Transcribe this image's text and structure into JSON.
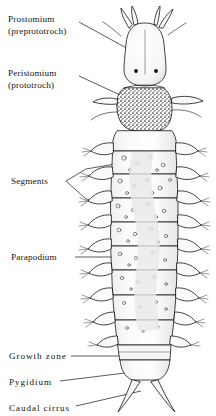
{
  "figure": {
    "title": "",
    "background_color": "#ffffff",
    "ink_color": "#141414"
  },
  "labels": [
    {
      "id": "prostomium",
      "line1": "Prostomium",
      "line2": "(preprototroch)",
      "x": 8,
      "y": 14,
      "leader": "diagonal-down-right"
    },
    {
      "id": "peristomium",
      "line1": "Peristomium",
      "line2": "(prototroch)",
      "x": 8,
      "y": 68,
      "leader": "diagonal-down-right"
    },
    {
      "id": "segments",
      "line1": "Segments",
      "line2": "",
      "x": 11,
      "y": 176,
      "leader": "forked-bracket-two-lines"
    },
    {
      "id": "parapodium",
      "line1": "Parapodium",
      "line2": "",
      "x": 11,
      "y": 252,
      "leader": "horizontal"
    },
    {
      "id": "growth-zone",
      "line1": "Growth zone",
      "line2": "",
      "x": 9,
      "y": 351,
      "leader": "horizontal"
    },
    {
      "id": "pygidium",
      "line1": "Pygidium",
      "line2": "",
      "x": 9,
      "y": 377,
      "leader": "horizontal-slight-rise"
    },
    {
      "id": "caudal-cirrus",
      "line1": "Caudal cirrus",
      "line2": "",
      "x": 9,
      "y": 403,
      "leader": "diagonal-up-right"
    }
  ],
  "anatomy": {
    "antennae_count": 4,
    "eye_spots": 2,
    "segment_count": 9,
    "parapodia_pairs": 9,
    "caudal_cirri": 2,
    "peristomium_shading": "dense-stipple",
    "segment_markings": "scattered-circular-papillae"
  }
}
